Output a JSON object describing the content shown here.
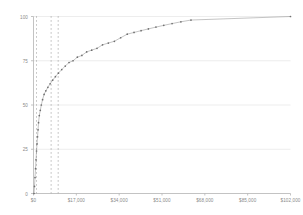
{
  "chart_data": {
    "type": "line",
    "title": "",
    "subtitle": "",
    "xlabel": "",
    "ylabel": "",
    "xlim": [
      0,
      102000
    ],
    "ylim": [
      0,
      100
    ],
    "grid": "horizontal",
    "legend": "none",
    "marker": "dotted-points",
    "line_color": "#6f6f6f",
    "grid_color": "#e9e9e9",
    "axis_color": "#b4b4b4",
    "text_color": "#8a8a8a",
    "x_tick_labels": [
      "$0",
      "$17,000",
      "$34,000",
      "$51,000",
      "$68,000",
      "$85,000",
      "$102,000"
    ],
    "x_tick_values": [
      0,
      17000,
      34000,
      51000,
      68000,
      85000,
      102000
    ],
    "y_tick_labels": [
      "0",
      "25",
      "50",
      "75",
      "100"
    ],
    "y_tick_values": [
      0,
      25,
      50,
      75,
      100
    ],
    "reference_lines": {
      "orientation": "vertical",
      "style": "dotted",
      "color": "#9a9a9a",
      "x_values": [
        1200,
        7000,
        9800
      ]
    },
    "series": [
      {
        "name": "Cumulative percent",
        "x": [
          200,
          400,
          600,
          800,
          1000,
          1200,
          1400,
          1600,
          1800,
          2000,
          2300,
          2700,
          3100,
          3600,
          4200,
          4900,
          5700,
          6600,
          7600,
          8700,
          9900,
          11200,
          12600,
          14100,
          15700,
          17400,
          19200,
          21100,
          23100,
          25200,
          27400,
          29700,
          32100,
          34600,
          37200,
          39900,
          42700,
          45600,
          48600,
          51700,
          55000,
          58500,
          62500,
          102000
        ],
        "y": [
          0,
          4,
          9,
          14,
          19,
          24,
          28,
          32,
          36,
          40,
          44,
          47,
          50,
          53,
          56,
          58,
          60,
          62,
          64,
          66,
          68,
          70,
          72,
          74,
          75,
          77,
          78,
          80,
          81,
          82,
          84,
          85,
          86,
          88,
          90,
          91,
          92,
          93,
          94,
          95,
          96,
          97,
          98,
          100
        ]
      }
    ]
  }
}
